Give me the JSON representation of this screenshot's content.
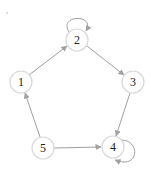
{
  "diagram": {
    "type": "directed-graph",
    "colors": {
      "edge": "#a0a0a0",
      "node_stroke": "#d9d9d9",
      "node_fill": "#ffffff",
      "label": "#222222"
    },
    "nodes": [
      {
        "id": "1",
        "label": "1",
        "x": 21,
        "y": 82
      },
      {
        "id": "2",
        "label": "2",
        "x": 77,
        "y": 40
      },
      {
        "id": "3",
        "label": "3",
        "x": 133,
        "y": 82
      },
      {
        "id": "4",
        "label": "4",
        "x": 113,
        "y": 147
      },
      {
        "id": "5",
        "label": "5",
        "x": 43,
        "y": 148
      }
    ],
    "edges": [
      {
        "from": "1",
        "to": "2"
      },
      {
        "from": "2",
        "to": "2"
      },
      {
        "from": "2",
        "to": "3"
      },
      {
        "from": "3",
        "to": "4"
      },
      {
        "from": "4",
        "to": "4"
      },
      {
        "from": "5",
        "to": "4"
      },
      {
        "from": "5",
        "to": "1"
      }
    ]
  }
}
